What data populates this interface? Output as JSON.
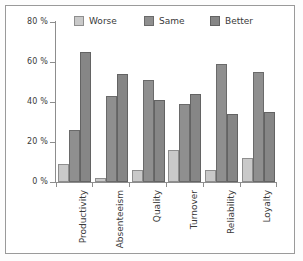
{
  "chart_data": {
    "type": "bar",
    "title": "",
    "subtitle": "",
    "xlabel": "",
    "ylabel": "",
    "ylim": [
      0,
      80
    ],
    "yticks": [
      0,
      20,
      40,
      60,
      80
    ],
    "ytick_labels": [
      "0 %",
      "20 %",
      "40 %",
      "60 %",
      "80 %"
    ],
    "grid": false,
    "legend_position": "top",
    "categories": [
      "Productivity",
      "Absenteeism",
      "Quality",
      "Turnover",
      "Reliability",
      "Loyalty"
    ],
    "series": [
      {
        "name": "Worse",
        "color": "#c9c9c9",
        "values": [
          9,
          2,
          6,
          16,
          6,
          12
        ]
      },
      {
        "name": "Same",
        "color": "#8f8f8f",
        "values": [
          26,
          43,
          51,
          39,
          59,
          55
        ]
      },
      {
        "name": "Better",
        "color": "#868686",
        "values": [
          65,
          54,
          41,
          44,
          34,
          35
        ]
      }
    ]
  },
  "axis": {
    "tick_labels": [
      "80 %",
      "60 %",
      "40 %",
      "20 %",
      "0 %"
    ]
  },
  "legend": {
    "items": [
      {
        "label": "Worse"
      },
      {
        "label": "Same"
      },
      {
        "label": "Better"
      }
    ]
  },
  "categories": [
    {
      "label": "Productivity"
    },
    {
      "label": "Absenteeism"
    },
    {
      "label": "Quality"
    },
    {
      "label": "Turnover"
    },
    {
      "label": "Reliability"
    },
    {
      "label": "Loyalty"
    }
  ]
}
